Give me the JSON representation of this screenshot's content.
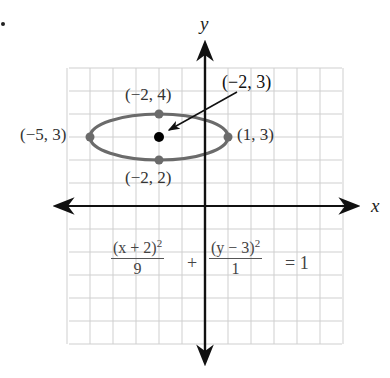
{
  "diagram": {
    "type": "ellipse-graph",
    "axes": {
      "x_label": "x",
      "y_label": "y"
    },
    "grid": {
      "x_range": [
        -6,
        6
      ],
      "y_range": [
        -6,
        6
      ],
      "cell_px": 23
    },
    "ellipse": {
      "center": {
        "x": -2,
        "y": 3,
        "label": "(−2, 3)"
      },
      "a": 3,
      "b": 1,
      "color": "#6b6b6b"
    },
    "points": [
      {
        "x": -5,
        "y": 3,
        "label": "(−5, 3)"
      },
      {
        "x": 1,
        "y": 3,
        "label": "(1, 3)"
      },
      {
        "x": -2,
        "y": 4,
        "label": "(−2, 4)"
      },
      {
        "x": -2,
        "y": 2,
        "label": "(−2, 2)"
      }
    ],
    "equation": {
      "term1_num": "(x + 2)",
      "term1_den": "9",
      "plus": "+",
      "term2_num": "(y − 3)",
      "term2_den": "1",
      "exp": "2",
      "rhs": "= 1"
    }
  }
}
